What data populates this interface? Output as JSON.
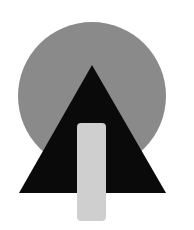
{
  "colors": {
    "background": "#ffffff",
    "circle": "#8a8a8a",
    "triangle": "#0a0a0a",
    "rectangle": "#cfcfcf"
  },
  "shapes": {
    "circle": {
      "cx": 92,
      "cy": 96,
      "r": 74
    },
    "triangle": {
      "points": "92,65 19,193 166,193"
    },
    "rectangle": {
      "x": 77,
      "y": 123,
      "width": 29,
      "height": 98,
      "rx": 4
    }
  }
}
